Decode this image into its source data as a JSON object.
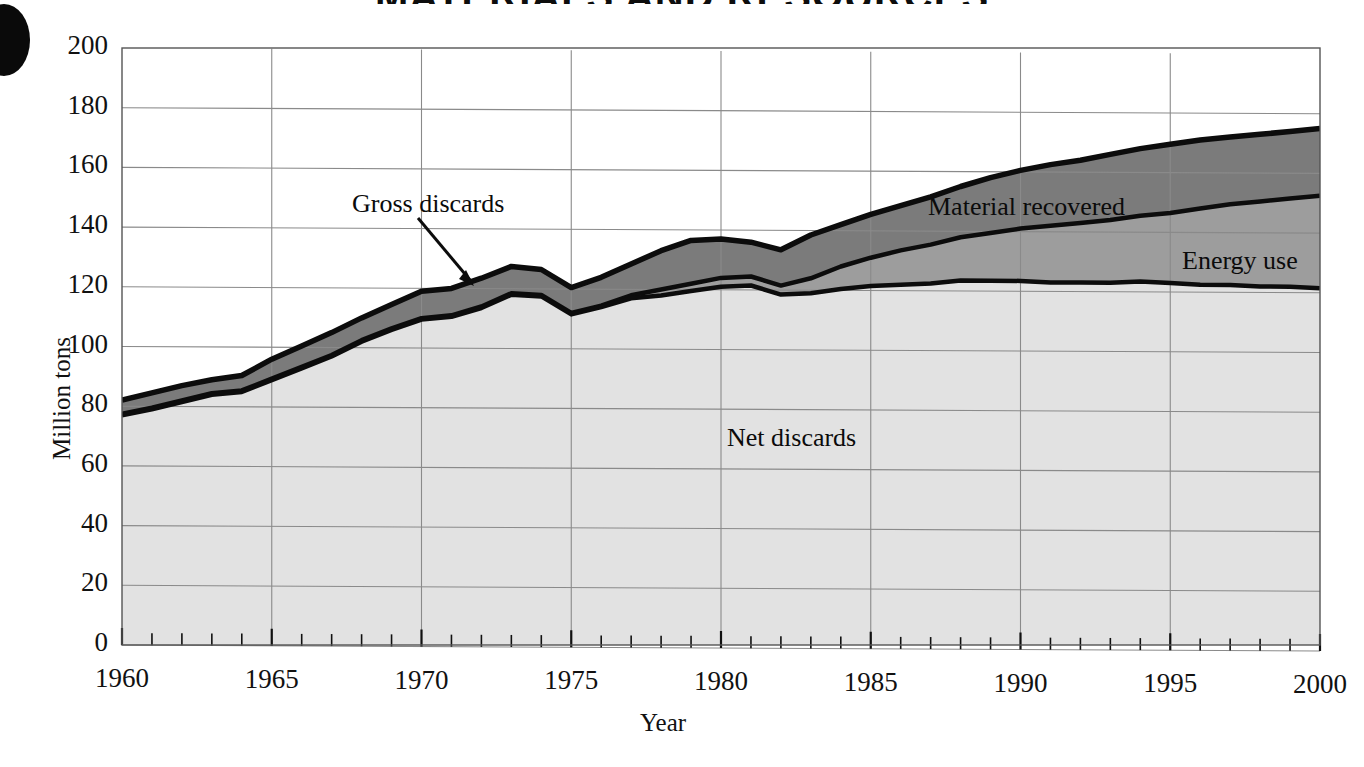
{
  "title": "MATERIALS AND RESOURCES",
  "axes": {
    "ylabel": "Million tons",
    "xlabel": "Year",
    "yticks": [
      "0",
      "20",
      "40",
      "60",
      "80",
      "100",
      "120",
      "140",
      "160",
      "180",
      "200"
    ],
    "xticks": [
      "1960",
      "1965",
      "1970",
      "1975",
      "1980",
      "1985",
      "1990",
      "1995",
      "2000"
    ]
  },
  "annotations": {
    "gross_discards": "Gross discards",
    "material_recovered": "Material recovered",
    "energy_use": "Energy use",
    "net_discards": "Net discards"
  },
  "colors": {
    "material_recovered": "#7b7b7b",
    "energy_use": "#9d9d9d",
    "net_discards": "#e2e2e2",
    "line": "#0c0c0c",
    "grid": "#8a8a8a",
    "background": "#ffffff"
  },
  "chart_data": {
    "type": "area",
    "stacked": true,
    "title": "MATERIALS AND RESOURCES",
    "xlabel": "Year",
    "ylabel": "Million tons",
    "xlim": [
      1960,
      2000
    ],
    "ylim": [
      0,
      200
    ],
    "ytick_step": 20,
    "xtick_step": 5,
    "minor_xticks": "annual",
    "grid": true,
    "legend": "inline-labels",
    "x": [
      1960,
      1961,
      1962,
      1963,
      1964,
      1965,
      1966,
      1967,
      1968,
      1969,
      1970,
      1971,
      1972,
      1973,
      1974,
      1975,
      1976,
      1977,
      1978,
      1979,
      1980,
      1981,
      1982,
      1983,
      1984,
      1985,
      1986,
      1987,
      1988,
      1989,
      1990,
      1991,
      1992,
      1993,
      1994,
      1995,
      1996,
      1997,
      1998,
      1999,
      2000
    ],
    "series": [
      {
        "name": "Net discards",
        "order": "bottom",
        "color": "#e2e2e2",
        "values": [
          77.0,
          79.0,
          81.5,
          84.0,
          85.0,
          89.0,
          93.0,
          97.0,
          102.0,
          106.0,
          109.5,
          110.5,
          113.5,
          118.0,
          117.5,
          111.5,
          114.0,
          117.0,
          118.0,
          119.5,
          121.0,
          121.5,
          118.5,
          119.0,
          120.5,
          121.5,
          122.0,
          122.5,
          123.5,
          123.5,
          123.5,
          123.0,
          123.0,
          123.0,
          123.5,
          123.0,
          122.5,
          122.5,
          122.0,
          122.0,
          121.5
        ]
      },
      {
        "name": "Energy use",
        "order": "middle",
        "color": "#9d9d9d",
        "cumulative_top": [
          77.5,
          79.5,
          82.0,
          84.5,
          85.5,
          89.5,
          93.5,
          97.5,
          102.5,
          106.5,
          110.0,
          111.0,
          114.0,
          118.5,
          118.0,
          112.0,
          114.5,
          118.0,
          120.0,
          122.0,
          124.0,
          124.5,
          121.5,
          124.0,
          128.0,
          131.0,
          133.5,
          135.5,
          138.0,
          139.5,
          141.0,
          142.0,
          143.0,
          144.0,
          145.5,
          146.5,
          148.0,
          149.5,
          150.5,
          151.5,
          152.5
        ],
        "values": [
          0.5,
          0.5,
          0.5,
          0.5,
          0.5,
          0.5,
          0.5,
          0.5,
          0.5,
          0.5,
          0.5,
          0.5,
          0.5,
          0.5,
          0.5,
          0.5,
          0.5,
          1.0,
          2.0,
          2.5,
          3.0,
          3.0,
          3.0,
          5.0,
          7.5,
          9.5,
          11.5,
          13.0,
          14.5,
          16.0,
          17.5,
          19.0,
          20.0,
          21.0,
          22.0,
          23.5,
          25.5,
          27.0,
          28.5,
          29.5,
          31.0
        ]
      },
      {
        "name": "Material recovered",
        "order": "top",
        "color": "#7b7b7b",
        "cumulative_top": [
          82.0,
          84.5,
          87.0,
          89.0,
          90.5,
          96.0,
          100.5,
          105.0,
          110.0,
          114.5,
          119.0,
          120.0,
          123.5,
          127.5,
          126.5,
          120.5,
          124.0,
          128.5,
          133.0,
          136.5,
          137.0,
          136.0,
          133.5,
          138.5,
          142.0,
          145.5,
          148.5,
          151.5,
          155.0,
          158.0,
          160.5,
          162.5,
          164.0,
          166.0,
          168.0,
          169.5,
          171.0,
          172.0,
          173.0,
          174.0,
          175.0
        ],
        "values": [
          4.5,
          5.0,
          5.0,
          4.5,
          5.0,
          6.5,
          7.0,
          7.5,
          7.5,
          8.0,
          9.0,
          9.0,
          9.5,
          9.0,
          8.5,
          8.5,
          9.5,
          10.5,
          13.0,
          14.5,
          13.0,
          11.5,
          12.0,
          14.5,
          14.0,
          14.5,
          15.0,
          16.0,
          17.0,
          18.5,
          19.5,
          20.5,
          21.0,
          22.0,
          22.5,
          23.0,
          23.0,
          22.5,
          22.5,
          22.5,
          22.5
        ]
      }
    ],
    "total_label": "Gross discards"
  }
}
